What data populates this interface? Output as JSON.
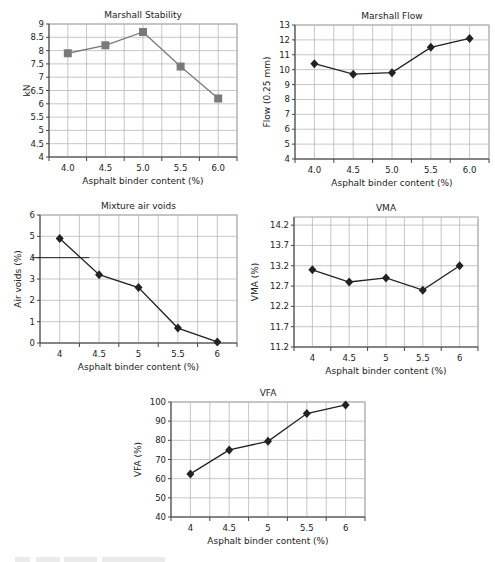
{
  "chart_data": [
    {
      "id": "stability",
      "type": "line",
      "title": "Marshall Stability",
      "xlabel": "Asphalt binder content (%)",
      "ylabel": "kN",
      "categories": [
        "4.0",
        "4.5",
        "5.0",
        "5.5",
        "6.0"
      ],
      "values": [
        7.9,
        8.2,
        8.7,
        7.4,
        6.2
      ],
      "ylim": [
        4,
        9
      ],
      "yticks": [
        4,
        4.5,
        5,
        5.5,
        6,
        6.5,
        7,
        7.5,
        8,
        8.5,
        9
      ],
      "ytick_labels": [
        "4",
        "4.5",
        "5",
        "5.5",
        "6",
        "6.5",
        "7",
        "7.5",
        "8",
        "8.5",
        "9"
      ],
      "marker": "square",
      "color": "#7a7a7a",
      "grid": true,
      "box": {
        "left": 49,
        "top": 24,
        "right": 237,
        "bottom": 157
      }
    },
    {
      "id": "flow",
      "type": "line",
      "title": "Marshall Flow",
      "xlabel": "Asphalt binder content (%)",
      "ylabel": "Flow (0.25 mm)",
      "categories": [
        "4.0",
        "4.5",
        "5.0",
        "5.5",
        "6.0"
      ],
      "values": [
        10.4,
        9.7,
        9.8,
        11.5,
        12.1
      ],
      "ylim": [
        4,
        13
      ],
      "yticks": [
        4,
        5,
        6,
        7,
        8,
        9,
        10,
        11,
        12,
        13
      ],
      "ytick_labels": [
        "4",
        "5",
        "6",
        "7",
        "8",
        "9",
        "10",
        "11",
        "12",
        "13"
      ],
      "marker": "diamond",
      "color": "#222222",
      "grid": true,
      "box": {
        "left": 295,
        "top": 25,
        "right": 489,
        "bottom": 159
      }
    },
    {
      "id": "airvoids",
      "type": "line",
      "title": "Mixture air voids",
      "xlabel": "Asphalt binder content (%)",
      "ylabel": "Air voids (%)",
      "categories": [
        "4",
        "4.5",
        "5",
        "5.5",
        "6"
      ],
      "values": [
        4.9,
        3.2,
        2.6,
        0.7,
        0.05
      ],
      "ylim": [
        0,
        6
      ],
      "yticks": [
        0,
        1,
        2,
        3,
        4,
        5,
        6
      ],
      "ytick_labels": [
        "0",
        "1",
        "2",
        "3",
        "4",
        "5",
        "6"
      ],
      "marker": "diamond",
      "color": "#222222",
      "grid": true,
      "annotation": {
        "type": "hline",
        "y": 4,
        "x_end_category_pos": 0.75
      },
      "box": {
        "left": 40,
        "top": 215,
        "right": 237,
        "bottom": 343
      }
    },
    {
      "id": "vma",
      "type": "line",
      "title": "VMA",
      "xlabel": "Asphalt binder content (%)",
      "ylabel": "VMA (%)",
      "categories": [
        "4",
        "4.5",
        "5",
        "5.5",
        "6"
      ],
      "values": [
        13.1,
        12.8,
        12.9,
        12.6,
        13.2
      ],
      "ylim": [
        11.2,
        14.4
      ],
      "yticks": [
        11.2,
        11.7,
        12.2,
        12.7,
        13.2,
        13.7,
        14.2
      ],
      "ytick_labels": [
        "11.2",
        "11.7",
        "12.2",
        "12.7",
        "13.2",
        "13.7",
        "14.2"
      ],
      "marker": "diamond",
      "color": "#222222",
      "grid": true,
      "box": {
        "left": 294,
        "top": 217,
        "right": 478,
        "bottom": 347
      }
    },
    {
      "id": "vfa",
      "type": "line",
      "title": "VFA",
      "xlabel": "Asphalt binder content (%)",
      "ylabel": "VFA (%)",
      "categories": [
        "4",
        "4.5",
        "5",
        "5.5",
        "6"
      ],
      "values": [
        62.5,
        75,
        79.5,
        94,
        98.5
      ],
      "ylim": [
        40,
        100
      ],
      "yticks": [
        40,
        50,
        60,
        70,
        80,
        90,
        100
      ],
      "ytick_labels": [
        "40",
        "50",
        "60",
        "70",
        "80",
        "90",
        "100"
      ],
      "marker": "diamond",
      "color": "#222222",
      "grid": true,
      "box": {
        "left": 171,
        "top": 402,
        "right": 365,
        "bottom": 517
      }
    }
  ]
}
